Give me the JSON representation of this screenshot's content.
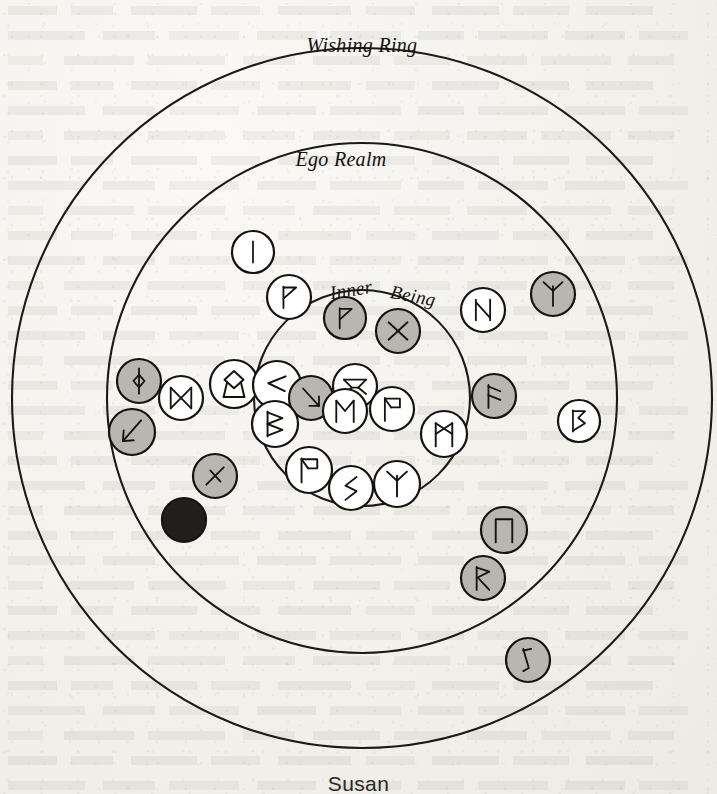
{
  "page": {
    "kind": "scanned-book-page",
    "caption": "Susan",
    "background_color": "#f3f2ee",
    "ink_color": "#15130f"
  },
  "diagram": {
    "center": {
      "x": 362,
      "y": 398
    },
    "rings": [
      {
        "id": "wishing-ring",
        "label": "Wishing Ring",
        "radius": 350,
        "label_x": 362,
        "label_y": 52,
        "stroke": "#1c1a17"
      },
      {
        "id": "ego-realm",
        "label": "Ego Realm",
        "radius": 255,
        "label_x": 341,
        "label_y": 166,
        "stroke": "#1c1a17"
      },
      {
        "id": "inner-being",
        "label_line1": "Inner",
        "label_line2": "Being",
        "radius": 108,
        "label1_x": 352,
        "label1_y": 296,
        "label2_x": 412,
        "label2_y": 302,
        "stroke": "#1c1a17"
      }
    ],
    "legend": {
      "shade_light": "#ffffff",
      "shade_shaded": "#b8b6b1",
      "shade_dark": "#211f1c"
    },
    "tokens": [
      {
        "id": "t01",
        "rune": "isa",
        "shade": "light",
        "x": 253,
        "y": 252,
        "r": 21
      },
      {
        "id": "t02",
        "rune": "thurisaz",
        "shade": "light",
        "x": 289,
        "y": 297,
        "r": 22
      },
      {
        "id": "t03",
        "rune": "thurisaz",
        "shade": "shaded",
        "x": 345,
        "y": 318,
        "r": 21
      },
      {
        "id": "t04",
        "rune": "gebo-ring",
        "shade": "shaded",
        "x": 398,
        "y": 331,
        "r": 22
      },
      {
        "id": "t05",
        "rune": "hagalaz",
        "shade": "light",
        "x": 483,
        "y": 310,
        "r": 22
      },
      {
        "id": "t06",
        "rune": "algiz",
        "shade": "shaded",
        "x": 553,
        "y": 294,
        "r": 22
      },
      {
        "id": "t07",
        "rune": "ansuz",
        "shade": "shaded",
        "x": 494,
        "y": 396,
        "r": 22
      },
      {
        "id": "t08",
        "rune": "perthro",
        "shade": "light",
        "x": 579,
        "y": 421,
        "r": 21
      },
      {
        "id": "t09",
        "rune": "ingwaz-dot",
        "shade": "shaded",
        "x": 139,
        "y": 381,
        "r": 22
      },
      {
        "id": "t10",
        "rune": "dagaz",
        "shade": "light",
        "x": 181,
        "y": 398,
        "r": 22
      },
      {
        "id": "t11",
        "rune": "othala",
        "shade": "light",
        "x": 234,
        "y": 384,
        "r": 24
      },
      {
        "id": "t12",
        "rune": "kenaz",
        "shade": "light",
        "x": 277,
        "y": 385,
        "r": 24
      },
      {
        "id": "t13",
        "rune": "kenaz-down",
        "shade": "shaded",
        "x": 311,
        "y": 398,
        "r": 22
      },
      {
        "id": "t14",
        "rune": "gebo-knot",
        "shade": "light",
        "x": 355,
        "y": 386,
        "r": 22
      },
      {
        "id": "t15",
        "rune": "ehwaz",
        "shade": "light",
        "x": 345,
        "y": 411,
        "r": 22
      },
      {
        "id": "t16",
        "rune": "wunjo",
        "shade": "light",
        "x": 392,
        "y": 409,
        "r": 22
      },
      {
        "id": "t17",
        "rune": "berkana",
        "shade": "light",
        "x": 275,
        "y": 424,
        "r": 23
      },
      {
        "id": "t18",
        "rune": "laguz-arrow",
        "shade": "shaded",
        "x": 132,
        "y": 432,
        "r": 23
      },
      {
        "id": "t19",
        "rune": "wunjo",
        "shade": "light",
        "x": 309,
        "y": 470,
        "r": 23
      },
      {
        "id": "t20",
        "rune": "sowilo",
        "shade": "light",
        "x": 351,
        "y": 488,
        "r": 22
      },
      {
        "id": "t21",
        "rune": "algiz",
        "shade": "light",
        "x": 397,
        "y": 484,
        "r": 23
      },
      {
        "id": "t22",
        "rune": "mannaz",
        "shade": "light",
        "x": 444,
        "y": 434,
        "r": 23
      },
      {
        "id": "t23",
        "rune": "nauthiz",
        "shade": "shaded",
        "x": 215,
        "y": 476,
        "r": 22
      },
      {
        "id": "t24",
        "rune": "blank",
        "shade": "dark",
        "x": 184,
        "y": 520,
        "r": 22
      },
      {
        "id": "t25",
        "rune": "uruz",
        "shade": "shaded",
        "x": 504,
        "y": 530,
        "r": 23
      },
      {
        "id": "t26",
        "rune": "raidho",
        "shade": "shaded",
        "x": 483,
        "y": 578,
        "r": 22
      },
      {
        "id": "t27",
        "rune": "laguz",
        "shade": "shaded",
        "x": 528,
        "y": 660,
        "r": 22
      }
    ]
  }
}
